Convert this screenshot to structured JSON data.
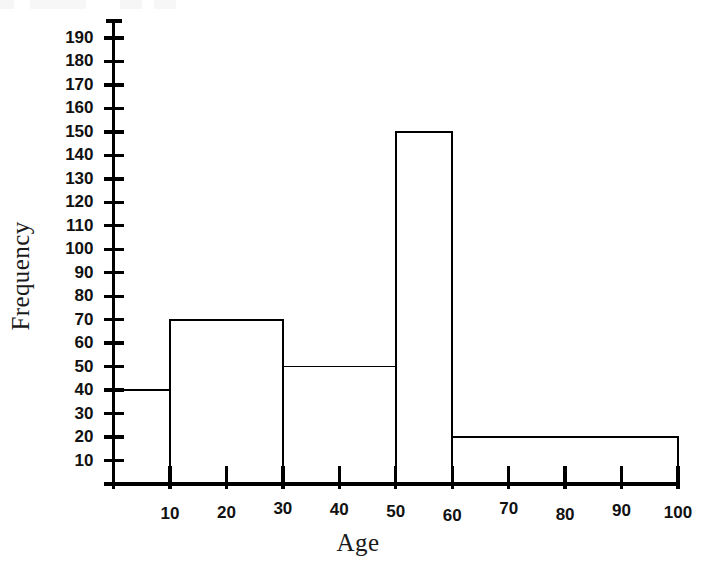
{
  "chart_data": {
    "type": "bar",
    "title": "",
    "subtitle": "",
    "xlabel": "Age",
    "ylabel": "Frequency",
    "bin_edges": [
      0,
      10,
      30,
      50,
      60,
      100
    ],
    "categories": [
      "0-10",
      "10-30",
      "30-50",
      "50-60",
      "60-100"
    ],
    "values": [
      40,
      70,
      50,
      150,
      20
    ],
    "bars": [
      {
        "label": "0-10",
        "x_start": 0,
        "x_end": 10,
        "value": 40
      },
      {
        "label": "10-30",
        "x_start": 10,
        "x_end": 30,
        "value": 70
      },
      {
        "label": "30-50",
        "x_start": 30,
        "x_end": 50,
        "value": 50
      },
      {
        "label": "50-60",
        "x_start": 50,
        "x_end": 60,
        "value": 150
      },
      {
        "label": "60-100",
        "x_start": 60,
        "x_end": 100,
        "value": 20
      }
    ],
    "xlim": [
      0,
      100
    ],
    "ylim": [
      0,
      196
    ],
    "xticks": [
      10,
      20,
      30,
      40,
      50,
      60,
      70,
      80,
      90,
      100
    ],
    "xtick_labels": [
      "10",
      "20",
      "30",
      "40",
      "50",
      "60",
      "70",
      "80",
      "90",
      "100"
    ],
    "yticks": [
      10,
      20,
      30,
      40,
      50,
      60,
      70,
      80,
      90,
      100,
      110,
      120,
      130,
      140,
      150,
      160,
      170,
      180,
      190
    ],
    "ytick_labels": [
      "10",
      "20",
      "30",
      "40",
      "50",
      "60",
      "70",
      "80",
      "90",
      "100",
      "110",
      "120",
      "130",
      "140",
      "150",
      "160",
      "170",
      "180",
      "190"
    ],
    "grid": false,
    "legend": null,
    "legend_position": "none",
    "bar_fill_color": "#ffffff",
    "bar_edge_color": "#000000",
    "axis_color": "#000000",
    "text_color": "#111111",
    "background_color": "#ffffff"
  },
  "axis_titles": {
    "x": "Age",
    "y": "Frequency"
  }
}
